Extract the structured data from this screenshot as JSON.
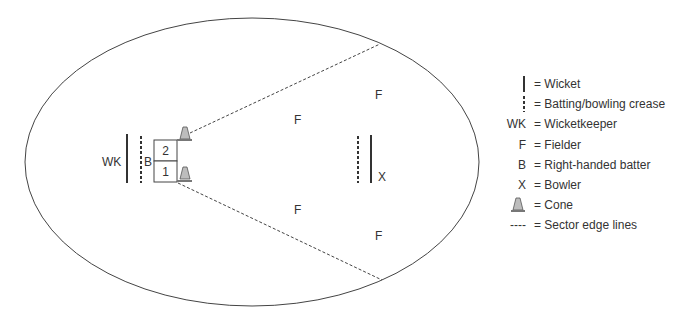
{
  "diagram": {
    "labels": {
      "wicketkeeper": "WK",
      "batter": "B",
      "zone_2": "2",
      "zone_1": "1",
      "fielder": "F",
      "bowler": "X"
    }
  },
  "legend": {
    "items": [
      {
        "symbol": "wicket",
        "symbol_text": "",
        "text": "= Wicket"
      },
      {
        "symbol": "crease",
        "symbol_text": "",
        "text": "= Batting/bowling crease"
      },
      {
        "symbol": "text",
        "symbol_text": "WK",
        "text": "= Wicketkeeper"
      },
      {
        "symbol": "text",
        "symbol_text": "F",
        "text": "= Fielder"
      },
      {
        "symbol": "text",
        "symbol_text": "B",
        "text": "= Right-handed batter"
      },
      {
        "symbol": "text",
        "symbol_text": "X",
        "text": "= Bowler"
      },
      {
        "symbol": "cone",
        "symbol_text": "",
        "text": "= Cone"
      },
      {
        "symbol": "dash",
        "symbol_text": "----",
        "text": "= Sector edge lines"
      }
    ]
  },
  "colors": {
    "line": "#333333",
    "cone_fill": "#bdbdbd"
  }
}
